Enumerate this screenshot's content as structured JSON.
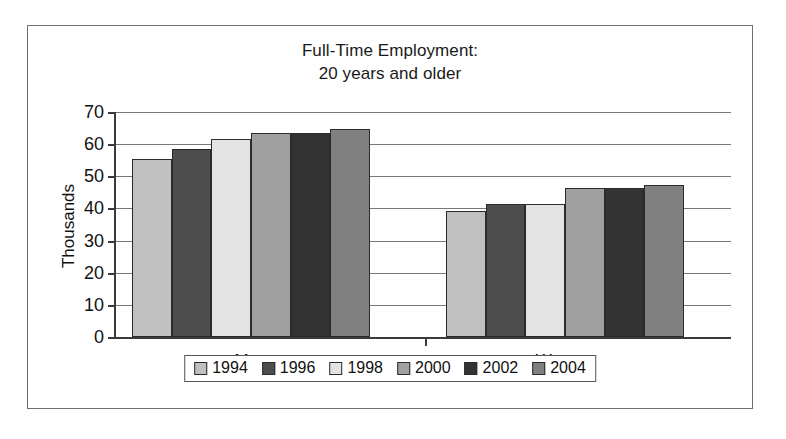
{
  "chart_data": {
    "type": "bar",
    "title": "Full-Time Employment: 20 years and older",
    "title_lines": [
      "Full-Time Employment:",
      "20 years and older"
    ],
    "xlabel": "",
    "ylabel": "Thousands",
    "ylim": [
      0,
      70
    ],
    "ytick_step": 10,
    "yticks": [
      70,
      60,
      50,
      40,
      30,
      20,
      10,
      0
    ],
    "ytick_labels": [
      "70",
      "60",
      "50",
      "40",
      "30",
      "20",
      "10",
      "0"
    ],
    "grid": true,
    "grid_axis": "y",
    "legend_position": "bottom",
    "categories": [
      "Men",
      "Women"
    ],
    "series": [
      {
        "name": "1994",
        "color": "#c0c0c0",
        "values": [
          55,
          39
        ]
      },
      {
        "name": "1996",
        "color": "#4d4d4d",
        "values": [
          58,
          41
        ]
      },
      {
        "name": "1998",
        "color": "#e3e3e3",
        "values": [
          61,
          41
        ]
      },
      {
        "name": "2000",
        "color": "#a0a0a0",
        "values": [
          63,
          46
        ]
      },
      {
        "name": "2002",
        "color": "#333333",
        "values": [
          63,
          46
        ]
      },
      {
        "name": "2004",
        "color": "#808080",
        "values": [
          64,
          47
        ]
      }
    ]
  },
  "colors": {
    "axis": "#3a3a3a",
    "gridline": "#787878",
    "frame": "#6f6f6f",
    "text": "#111111",
    "background": "#ffffff"
  }
}
